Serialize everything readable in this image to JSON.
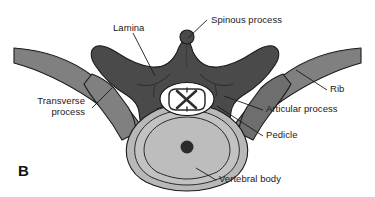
{
  "figure": {
    "panel_letter": "B",
    "background_color": "#ffffff",
    "colors": {
      "vertebral_arch": "#4a4a4a",
      "rib": "#808080",
      "articular_process": "#6e6e6e",
      "vertebral_body": "#b8b8b8",
      "vertebral_body_inner": "#c2c2c2",
      "spinal_cord_white": "#ffffff",
      "spinal_cord_gray_matter": "#2e2e2e",
      "center_dot": "#2b2b2b",
      "outline": "#1a1a1a",
      "leader_line": "#1a1a1a",
      "label_text": "#1a1a1a"
    },
    "labels": [
      {
        "id": "lamina",
        "text": "Lamina",
        "x": 113,
        "y": 22,
        "align": "left",
        "lines": 1
      },
      {
        "id": "spinous-process",
        "text": "Spinous process",
        "x": 211,
        "y": 14,
        "align": "left",
        "lines": 1
      },
      {
        "id": "rib",
        "text": "Rib",
        "x": 330,
        "y": 87,
        "align": "left",
        "lines": 1
      },
      {
        "id": "articular-process",
        "text": "Articular process",
        "x": 266,
        "y": 107,
        "align": "left",
        "lines": 1
      },
      {
        "id": "pedicle",
        "text": "Pedicle",
        "x": 266,
        "y": 133,
        "align": "left",
        "lines": 1
      },
      {
        "id": "transverse-process",
        "text": "Transverse process",
        "x": 18,
        "y": 100,
        "align": "right",
        "lines": 2
      },
      {
        "id": "vertebral-body",
        "text": "Vertebral body",
        "x": 219,
        "y": 177,
        "align": "left",
        "lines": 1
      }
    ],
    "structures": [
      {
        "id": "vertebral-arch",
        "name": "vertebral-arch-shape"
      },
      {
        "id": "left-rib",
        "name": "left-rib-shape"
      },
      {
        "id": "right-rib",
        "name": "right-rib-shape"
      },
      {
        "id": "left-transverse-process",
        "name": "left-transverse-process-shape"
      },
      {
        "id": "right-articular-process",
        "name": "right-articular-process-shape"
      },
      {
        "id": "left-articular-process",
        "name": "left-articular-process-shape"
      },
      {
        "id": "vertebral-body",
        "name": "vertebral-body-shape"
      },
      {
        "id": "spinal-cord",
        "name": "spinal-cord-shape"
      },
      {
        "id": "spinous-process",
        "name": "spinous-process-tip"
      }
    ]
  }
}
